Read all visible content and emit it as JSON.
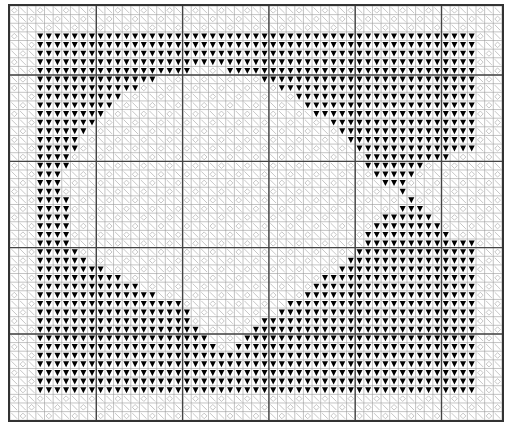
{
  "chart": {
    "cols": 57,
    "rows": 48,
    "cell_px": 8.63,
    "bold_every": 10,
    "bold_col_offset": 0,
    "bold_row_offset": 8,
    "colors": {
      "background": "#ffffff",
      "grid": "#9a9a9a",
      "bold_grid": "#444444",
      "symbol_light": "#b8b8b8",
      "symbol_dark": "#000000"
    },
    "symbols": {
      "border_fill": "slash-and-diamond",
      "background_dark": "black-down-triangle",
      "fish_body": "slash-and-diamond"
    },
    "dark_region": {
      "col_start": 3,
      "col_end": 53,
      "row_start": 3,
      "row_end": 44
    },
    "fish_light_spans": [
      {
        "row": 7,
        "spans": [
          [
            21,
            24
          ]
        ]
      },
      {
        "row": 8,
        "spans": [
          [
            17,
            28
          ]
        ]
      },
      {
        "row": 9,
        "spans": [
          [
            15,
            30
          ]
        ]
      },
      {
        "row": 10,
        "spans": [
          [
            13,
            32
          ]
        ]
      },
      {
        "row": 11,
        "spans": [
          [
            12,
            33
          ]
        ]
      },
      {
        "row": 12,
        "spans": [
          [
            11,
            34
          ]
        ]
      },
      {
        "row": 13,
        "spans": [
          [
            10,
            36
          ]
        ]
      },
      {
        "row": 14,
        "spans": [
          [
            9,
            37
          ]
        ]
      },
      {
        "row": 15,
        "spans": [
          [
            8,
            38
          ]
        ]
      },
      {
        "row": 16,
        "spans": [
          [
            8,
            39
          ]
        ]
      },
      {
        "row": 17,
        "spans": [
          [
            7,
            40
          ],
          [
            51,
            53
          ]
        ]
      },
      {
        "row": 18,
        "spans": [
          [
            7,
            40
          ],
          [
            48,
            53
          ]
        ]
      },
      {
        "row": 19,
        "spans": [
          [
            6,
            41
          ],
          [
            47,
            53
          ]
        ]
      },
      {
        "row": 20,
        "spans": [
          [
            6,
            42
          ],
          [
            46,
            53
          ]
        ]
      },
      {
        "row": 21,
        "spans": [
          [
            6,
            44
          ],
          [
            46,
            53
          ]
        ]
      },
      {
        "row": 22,
        "spans": [
          [
            7,
            45
          ],
          [
            47,
            53
          ]
        ]
      },
      {
        "row": 23,
        "spans": [
          [
            7,
            44
          ],
          [
            48,
            53
          ]
        ]
      },
      {
        "row": 24,
        "spans": [
          [
            7,
            42
          ],
          [
            49,
            53
          ]
        ]
      },
      {
        "row": 25,
        "spans": [
          [
            7,
            41
          ],
          [
            50,
            53
          ]
        ]
      },
      {
        "row": 26,
        "spans": [
          [
            7,
            40
          ],
          [
            51,
            53
          ]
        ]
      },
      {
        "row": 27,
        "spans": [
          [
            7,
            40
          ]
        ]
      },
      {
        "row": 28,
        "spans": [
          [
            8,
            39
          ]
        ]
      },
      {
        "row": 29,
        "spans": [
          [
            9,
            38
          ]
        ]
      },
      {
        "row": 30,
        "spans": [
          [
            11,
            37
          ]
        ]
      },
      {
        "row": 31,
        "spans": [
          [
            13,
            35
          ]
        ]
      },
      {
        "row": 32,
        "spans": [
          [
            15,
            34
          ]
        ]
      },
      {
        "row": 33,
        "spans": [
          [
            17,
            33
          ]
        ]
      },
      {
        "row": 34,
        "spans": [
          [
            20,
            31
          ]
        ]
      },
      {
        "row": 35,
        "spans": [
          [
            21,
            30
          ]
        ]
      },
      {
        "row": 36,
        "spans": [
          [
            21,
            28
          ]
        ]
      },
      {
        "row": 37,
        "spans": [
          [
            22,
            27
          ]
        ]
      },
      {
        "row": 38,
        "spans": [
          [
            23,
            26
          ]
        ]
      },
      {
        "row": 39,
        "spans": [
          [
            24,
            25
          ]
        ]
      }
    ]
  }
}
